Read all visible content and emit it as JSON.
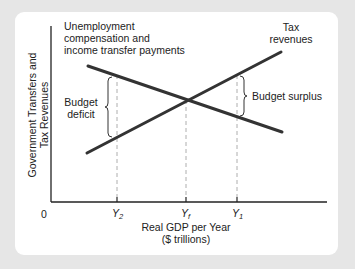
{
  "diagram": {
    "type": "economics-line-diagram",
    "axes": {
      "y_label_line1": "Government Transfers and",
      "y_label_line2": "Tax Revenues",
      "x_label_line1": "Real GDP per Year",
      "x_label_line2": "($ trillions)",
      "origin": "0"
    },
    "ticks": [
      {
        "base": "Y",
        "sub": "2",
        "x": 117
      },
      {
        "base": "Y",
        "sub": "f",
        "x": 186
      },
      {
        "base": "Y",
        "sub": "1",
        "x": 237
      }
    ],
    "curves": [
      {
        "name": "Unemployment compensation and income transfer payments",
        "slope": "downward"
      },
      {
        "name": "Tax revenues",
        "slope": "upward"
      }
    ],
    "labels": {
      "transfers_line1": "Unemployment",
      "transfers_line2": "compensation and",
      "transfers_line3": "income transfer payments",
      "tax_line1": "Tax",
      "tax_line2": "revenues",
      "deficit_line1": "Budget",
      "deficit_line2": "deficit",
      "surplus": "Budget surplus"
    },
    "colors": {
      "background": "#e6e6e6",
      "panel": "#ffffff",
      "line": "#333333",
      "axis": "#222222",
      "dashed": "#999999"
    }
  }
}
